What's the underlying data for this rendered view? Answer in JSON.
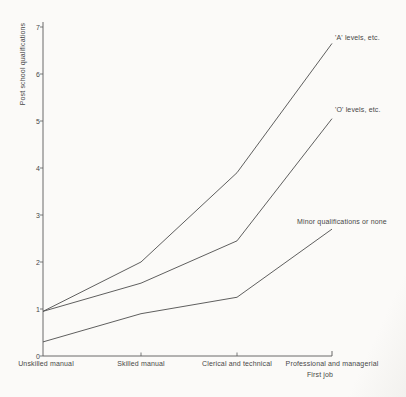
{
  "figure": {
    "background": "#fbfaf8",
    "line_color": "#4d4d4d",
    "axis_color": "#5a5a5a",
    "text_color": "#474747"
  },
  "chart_data": {
    "type": "line",
    "title": "",
    "xlabel": "First job",
    "ylabel": "Post school qualifications",
    "categories": [
      "Unskilled manual",
      "Skilled manual",
      "Clerical and technical",
      "Professional and managerial"
    ],
    "y_ticks": [
      0,
      1,
      2,
      3,
      4,
      5,
      6,
      7
    ],
    "ylim": [
      0,
      7
    ],
    "grid": false,
    "legend_position": "labels-at-line-ends",
    "series": [
      {
        "name": "'A' levels, etc.",
        "values": [
          0.95,
          2.0,
          3.9,
          6.65
        ]
      },
      {
        "name": "'O' levels, etc.",
        "values": [
          0.95,
          1.55,
          2.45,
          5.05
        ]
      },
      {
        "name": "Minor qualifications or none",
        "values": [
          0.3,
          0.9,
          1.25,
          2.7
        ]
      }
    ]
  }
}
